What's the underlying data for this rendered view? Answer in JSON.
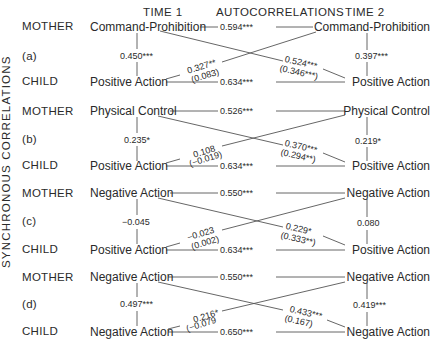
{
  "header": {
    "time1": "TIME  1",
    "autocorrelations": "AUTOCORRELATIONS",
    "time2": "TIME  2"
  },
  "side_label": "SYNCHRONOUS  CORRELATIONS",
  "panels": [
    {
      "id": "(a)",
      "mother_label": "MOTHER",
      "child_label": "CHILD",
      "mother_var_t1": "Command-Prohibition",
      "mother_var_t2": "Command-Prohibition",
      "child_var_t1": "Positive Action",
      "child_var_t2": "Positive Action",
      "sync_t1": "0.450***",
      "sync_t2": "0.397***",
      "auto_mother": "0.594***",
      "auto_child": "0.634***",
      "cross_child_to_mother": "0.327**",
      "cross_child_to_mother_partial": "(0.083)",
      "cross_mother_to_child": "0.524***",
      "cross_mother_to_child_partial": "(0.346***)"
    },
    {
      "id": "(b)",
      "mother_label": "MOTHER",
      "child_label": "CHILD",
      "mother_var_t1": "Physical Control",
      "mother_var_t2": "Physical Control",
      "child_var_t1": "Positive Action",
      "child_var_t2": "Positive Action",
      "sync_t1": "0.235*",
      "sync_t2": "0.219*",
      "auto_mother": "0.526***",
      "auto_child": "0.634***",
      "cross_child_to_mother": "0.108",
      "cross_child_to_mother_partial": "(−0.019)",
      "cross_mother_to_child": "0.370***",
      "cross_mother_to_child_partial": "(0.294**)"
    },
    {
      "id": "(c)",
      "mother_label": "MOTHER",
      "child_label": "CHILD",
      "mother_var_t1": "Negative Action",
      "mother_var_t2": "Negative Action",
      "child_var_t1": "Positive Action",
      "child_var_t2": "Positive Action",
      "sync_t1": "−0.045",
      "sync_t2": "0.080",
      "auto_mother": "0.550***",
      "auto_child": "0.634***",
      "cross_child_to_mother": "−0.023",
      "cross_child_to_mother_partial": "(0.002)",
      "cross_mother_to_child": "0.229*",
      "cross_mother_to_child_partial": "(0.333**)"
    },
    {
      "id": "(d)",
      "mother_label": "MOTHER",
      "child_label": "CHILD",
      "mother_var_t1": "Negative Action",
      "mother_var_t2": "Negative Action",
      "child_var_t1": "Negative Action",
      "child_var_t2": "Negative Action",
      "sync_t1": "0.497***",
      "sync_t2": "0.419***",
      "auto_mother": "0.550***",
      "auto_child": "0.650***",
      "cross_child_to_mother": "0.216*",
      "cross_child_to_mother_partial": "(−0.079",
      "cross_mother_to_child": "0.433***",
      "cross_mother_to_child_partial": "(0.167)"
    }
  ]
}
